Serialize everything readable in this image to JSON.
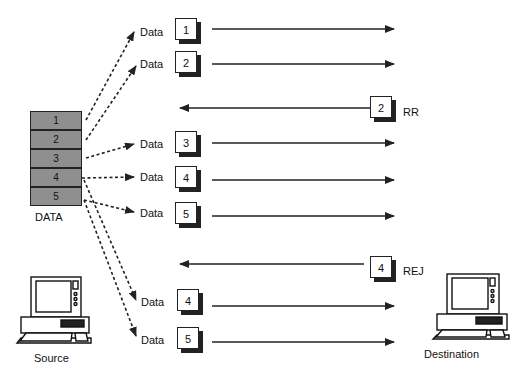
{
  "buffer": {
    "label": "DATA",
    "cells": [
      "1",
      "2",
      "3",
      "4",
      "5"
    ]
  },
  "frames": [
    {
      "label": "Data",
      "number": "1",
      "direction": "forward"
    },
    {
      "label": "Data",
      "number": "2",
      "direction": "forward"
    },
    {
      "label": "RR",
      "number": "2",
      "direction": "backward"
    },
    {
      "label": "Data",
      "number": "3",
      "direction": "forward"
    },
    {
      "label": "Data",
      "number": "4",
      "direction": "forward"
    },
    {
      "label": "Data",
      "number": "5",
      "direction": "forward"
    },
    {
      "label": "REJ",
      "number": "4",
      "direction": "backward"
    },
    {
      "label": "Data",
      "number": "4",
      "direction": "forward"
    },
    {
      "label": "Data",
      "number": "5",
      "direction": "forward"
    }
  ],
  "nodes": {
    "source": "Source",
    "destination": "Destination"
  }
}
